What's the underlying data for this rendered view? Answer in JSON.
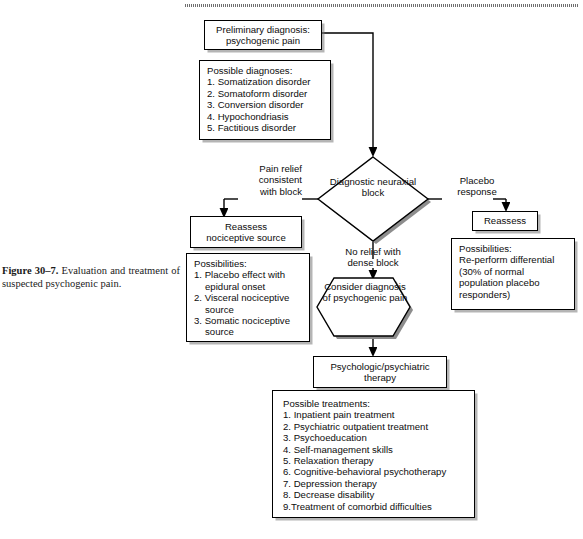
{
  "figure": {
    "caption_label": "Figure 30–7.",
    "caption_text": "Evaluation and treatment of suspected psychogenic pain."
  },
  "nodes": {
    "preliminary": {
      "line1": "Preliminary diagnosis:",
      "line2": "psychogenic pain"
    },
    "possible_diagnoses": {
      "heading": "Possible diagnoses:",
      "items": [
        "1. Somatization disorder",
        "2. Somatoform disorder",
        "3. Conversion disorder",
        "4. Hypochondriasis",
        "5. Factitious disorder"
      ]
    },
    "diagnostic_block": {
      "line1": "Diagnostic",
      "line2": "neuraxial",
      "line3": "block"
    },
    "reassess_nociceptive": {
      "line1": "Reassess",
      "line2": "nociceptive source"
    },
    "possibilities_left": {
      "heading": "Possibilities:",
      "items": [
        "1. Placebo effect with",
        "epidural onset",
        "2. Visceral nociceptive",
        "source",
        "3. Somatic nociceptive",
        "source"
      ]
    },
    "reassess_right": {
      "label": "Reassess"
    },
    "possibilities_right": {
      "heading": "Possibilities:",
      "items": [
        "Re-perform differential",
        "(30% of normal",
        "population placebo",
        "responders)"
      ]
    },
    "consider_diagnosis": {
      "line1": "Consider",
      "line2": "diagnosis of",
      "line3": "psychogenic",
      "line4": "pain"
    },
    "therapy": {
      "line1": "Psychologic/psychiatric",
      "line2": "therapy"
    },
    "possible_treatments": {
      "heading": "Possible treatments:",
      "items": [
        "1. Inpatient pain treatment",
        "2. Psychiatric outpatient treatment",
        "3. Psychoeducation",
        "4. Self-management skills",
        "5. Relaxation therapy",
        "6. Cognitive-behavioral psychotherapy",
        "7. Depression therapy",
        "8. Decrease disability",
        "9.Treatment of comorbid difficulties"
      ]
    }
  },
  "edge_labels": {
    "pain_relief": {
      "l1": "Pain relief",
      "l2": "consistent",
      "l3": "with block"
    },
    "placebo_response": {
      "l1": "Placebo",
      "l2": "response"
    },
    "no_relief": {
      "l1": "No relief with",
      "l2": "dense block"
    }
  },
  "colors": {
    "line": "#000000",
    "shadow": "#787878",
    "background": "#ffffff",
    "text": "#0d0d0d"
  }
}
